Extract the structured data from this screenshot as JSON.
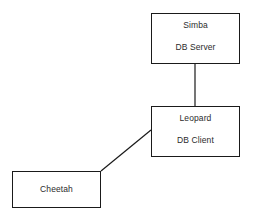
{
  "diagram": {
    "type": "network-topology",
    "background_color": "#ffffff",
    "line_color": "#1a1a1a",
    "text_color": "#2b2b2b",
    "nodes": [
      {
        "id": "simba",
        "name": "Simba",
        "role": "DB Server",
        "x": 151,
        "y": 13,
        "width": 89,
        "height": 51
      },
      {
        "id": "leopard",
        "name": "Leopard",
        "role": "DB Client",
        "x": 151,
        "y": 106,
        "width": 89,
        "height": 51
      },
      {
        "id": "cheetah",
        "name": "Cheetah",
        "role": "",
        "x": 12,
        "y": 171,
        "width": 89,
        "height": 37
      }
    ],
    "connections": [
      {
        "id": "simba-leopard",
        "from": "simba",
        "to": "leopard",
        "orientation": "vertical",
        "x1": 195,
        "y1": 64,
        "x2": 195,
        "y2": 106
      },
      {
        "id": "cheetah-leopard",
        "from": "cheetah",
        "to": "leopard",
        "orientation": "diagonal",
        "x1": 101,
        "y1": 171,
        "x2": 151,
        "y2": 130
      }
    ]
  }
}
